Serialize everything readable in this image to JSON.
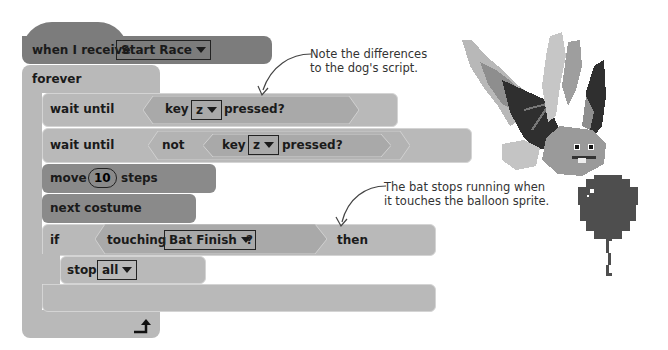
{
  "script": {
    "hat": {
      "label": "when I receive",
      "message": "Start Race"
    },
    "forever": {
      "label": "forever"
    },
    "wait1": {
      "label": "wait until",
      "key_label": "key",
      "key": "z",
      "pressed": "pressed?"
    },
    "wait2": {
      "label": "wait until",
      "not_label": "not",
      "key_label": "key",
      "key": "z",
      "pressed": "pressed?"
    },
    "move": {
      "label": "move",
      "value": "10",
      "suffix": "steps"
    },
    "next_costume": {
      "label": "next costume"
    },
    "if_block": {
      "label": "if",
      "touching_label": "touching",
      "target": "Bat Finish",
      "question": "?",
      "then_label": "then"
    },
    "stop": {
      "label": "stop",
      "option": "all"
    }
  },
  "annotations": {
    "note1_line1": "Note the differences",
    "note1_line2": "to the dog's script.",
    "note2_line1": "The bat stops running when",
    "note2_line2": "it touches the balloon sprite."
  },
  "colors": {
    "hat": "#7c7c7c",
    "control": "#b9b9b9",
    "sensing": "#a9a9a9",
    "motion_looks": "#8a8a8a"
  },
  "sprites": [
    "bat",
    "balloon"
  ]
}
